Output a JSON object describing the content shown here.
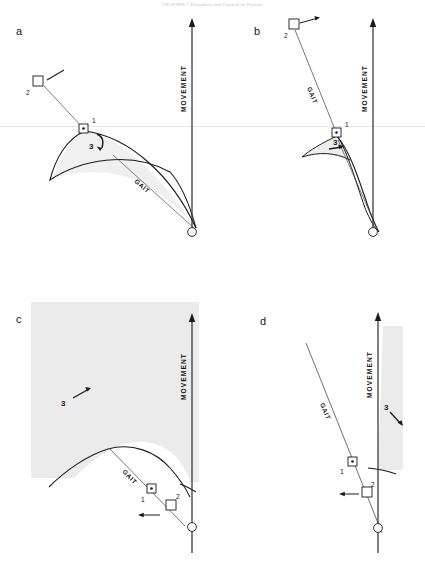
{
  "figure": {
    "running_head": "CHAPTER 7 Dynamics and Control of Posture",
    "type": "scientific-line-diagram",
    "panel_count": 4,
    "background_color": "#ffffff",
    "ink_color": "#1a1a1a",
    "shade_color": "#ebebeb"
  },
  "labels": {
    "movement": "MOVEMENT",
    "gait": "GAIT",
    "marker_one": "1",
    "marker_two": "2",
    "marker_three": "3"
  },
  "panels": [
    {
      "id": "a",
      "label": "a",
      "movement_label": "MOVEMENT",
      "gait_label": "GAIT",
      "markers": [
        "1",
        "2",
        "3"
      ],
      "marker_one_style": "square-with-center-dot",
      "marker_two_style": "hollow-square",
      "marker_three_style": "curved-arrow",
      "shaded_region": "lens-shaped-crescent",
      "shade_color": "#efefef"
    },
    {
      "id": "b",
      "label": "b",
      "movement_label": "MOVEMENT",
      "gait_label": "GAIT",
      "markers": [
        "1",
        "2",
        "3"
      ],
      "marker_one_style": "square-with-center-dot",
      "marker_two_style": "hollow-square",
      "marker_three_style": "straight-arrow",
      "shaded_region": "narrow-curved-sliver",
      "shade_color": "#ededed"
    },
    {
      "id": "c",
      "label": "c",
      "movement_label": "MOVEMENT",
      "gait_label": "GAIT",
      "markers": [
        "1",
        "2",
        "3"
      ],
      "marker_one_style": "square-with-center-dot",
      "marker_two_style": "hollow-square",
      "marker_three_style": "straight-arrow",
      "shaded_region": "large-area-above-arc",
      "shade_color": "#ebebeb"
    },
    {
      "id": "d",
      "label": "d",
      "movement_label": "MOVEMENT",
      "gait_label": "GAIT",
      "markers": [
        "1",
        "2",
        "3"
      ],
      "marker_one_style": "square-with-center-dot",
      "marker_two_style": "hollow-square",
      "marker_three_style": "straight-arrow",
      "shaded_region": "narrow-vertical-band",
      "shade_color": "#ebebeb"
    }
  ]
}
